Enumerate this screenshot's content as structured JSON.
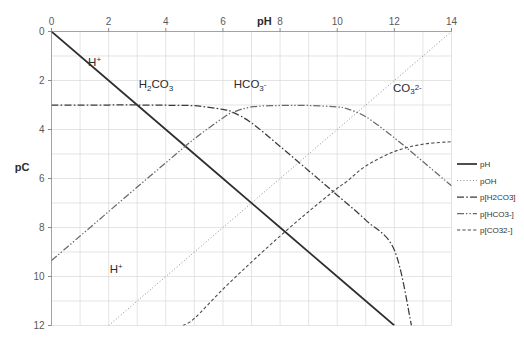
{
  "chart_data": {
    "type": "line",
    "title": "",
    "xlabel": "pH",
    "ylabel": "pC",
    "xlim": [
      0,
      14
    ],
    "ylim": [
      12,
      0
    ],
    "xticks": [
      0,
      2,
      4,
      6,
      8,
      10,
      12,
      14
    ],
    "xtick_labels": [
      "0",
      "2",
      "4",
      "6",
      "8",
      "10",
      "12",
      "14"
    ],
    "yticks": [
      0,
      2,
      4,
      6,
      8,
      10,
      12
    ],
    "ytick_labels": [
      "0",
      "2",
      "4",
      "6",
      "8",
      "10",
      "12"
    ],
    "grid": true,
    "grid_minor_step_x": 1,
    "grid_minor_step_y": 1,
    "y_axis_inverted": true,
    "legend_position": "right",
    "system": "carbonate",
    "total_carbonate_pC": 3,
    "pKa1": 6.35,
    "pKa2": 10.33,
    "pKw": 14,
    "series": [
      {
        "name": "pH",
        "legend_label": "pH",
        "style": "solid",
        "x": [
          0,
          2,
          4,
          6,
          8,
          10,
          12
        ],
        "y": [
          0,
          2,
          4,
          6,
          8,
          10,
          12
        ]
      },
      {
        "name": "pOH",
        "legend_label": "pOH",
        "style": "dotted",
        "x": [
          2,
          4,
          6,
          8,
          10,
          12,
          14
        ],
        "y": [
          12,
          10,
          8,
          6,
          4,
          2,
          0
        ]
      },
      {
        "name": "p[H2CO3]",
        "legend_label": "p[H2CO3]",
        "style": "dashdot",
        "x": [
          0,
          1,
          2,
          3,
          4,
          5,
          6,
          6.35,
          7,
          8,
          9,
          10,
          11,
          12,
          12.6
        ],
        "y": [
          3.0,
          3.0,
          3.0,
          3.0,
          3.01,
          3.03,
          3.18,
          3.3,
          3.73,
          4.69,
          5.68,
          6.68,
          7.7,
          8.92,
          12.0
        ]
      },
      {
        "name": "p[HCO3-]",
        "legend_label": "p[HCO3-]",
        "style": "dashdotdot",
        "x": [
          0,
          1,
          2,
          3,
          4,
          5,
          6,
          6.35,
          7,
          8,
          9,
          10,
          10.33,
          11,
          12,
          13,
          14
        ],
        "y": [
          9.35,
          8.35,
          7.35,
          6.35,
          5.36,
          4.38,
          3.53,
          3.3,
          3.08,
          3.02,
          3.02,
          3.08,
          3.15,
          3.48,
          4.34,
          5.31,
          6.3
        ]
      },
      {
        "name": "p[CO32-]",
        "legend_label": "p[CO32-]",
        "style": "dashed",
        "x": [
          4.6,
          5,
          6,
          7,
          8,
          9,
          10,
          10.33,
          11,
          12,
          13,
          14
        ],
        "y": [
          12.0,
          11.71,
          10.52,
          9.41,
          8.35,
          7.35,
          6.4,
          6.13,
          5.49,
          4.9,
          4.6,
          4.5
        ]
      }
    ],
    "annotations": [
      {
        "text": "H+",
        "x": 1.45,
        "y": 1.2,
        "series": "pH"
      },
      {
        "text": "H+",
        "x": 2.2,
        "y": 9.65,
        "series": "pOH"
      },
      {
        "text": "H2CO3",
        "x": 3.3,
        "y": 2.1,
        "series": "p[H2CO3]"
      },
      {
        "text": "HCO3-",
        "x": 6.6,
        "y": 2.1,
        "series": "p[HCO3-]"
      },
      {
        "text": "CO32-",
        "x": 12.2,
        "y": 2.25,
        "series": "p[CO32-]"
      }
    ]
  },
  "axes": {
    "x_title": "pH",
    "y_title": "pC",
    "x_tick_labels": [
      "0",
      "2",
      "4",
      "6",
      "8",
      "10",
      "12",
      "14"
    ],
    "y_tick_labels": [
      "0",
      "2",
      "4",
      "6",
      "8",
      "10",
      "12"
    ]
  },
  "species_labels": {
    "hplus_upper": {
      "main": "H",
      "sup": "+"
    },
    "hplus_lower": {
      "main": "H",
      "sup": "+"
    },
    "h2co3": {
      "pre": "H",
      "sub1": "2",
      "mid": "CO",
      "sub2": "3"
    },
    "hco3": {
      "pre": "HCO",
      "sub": "3",
      "sup": "-"
    },
    "co3": {
      "pre": "CO",
      "sub": "3",
      "sup": "2-"
    }
  },
  "legend": {
    "items": [
      {
        "label": "pH",
        "style": "solid"
      },
      {
        "label": "pOH",
        "style": "dotted"
      },
      {
        "label": "p[H2CO3]",
        "style": "dashdot"
      },
      {
        "label": "p[HCO3-]",
        "style": "dashdotdot"
      },
      {
        "label": "p[CO32-]",
        "style": "dashed"
      }
    ]
  }
}
